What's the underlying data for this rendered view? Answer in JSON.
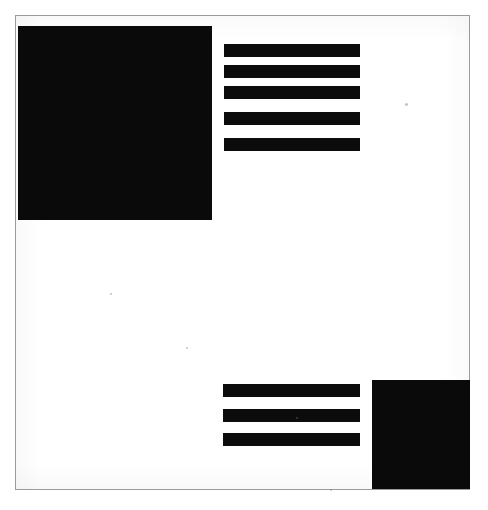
{
  "image": {
    "title": "Abstract black and white geometric pattern",
    "description": "High-contrast scanned graphic with solid black squares and horizontal bar groups on white paper",
    "width": 488,
    "height": 510,
    "background_color": "#ffffff",
    "ink_color": "#0a0a0a",
    "frame_color": "#9a9a9a"
  },
  "frame": {
    "label": "paper-frame",
    "x": 15,
    "y": 15,
    "width": 455,
    "height": 475,
    "border_width": 1
  },
  "shapes": [
    {
      "name": "top-left-square",
      "type": "rectangle",
      "color": "#0a0a0a",
      "x": 18,
      "y": 26,
      "width": 194,
      "height": 194
    },
    {
      "name": "bottom-right-square",
      "type": "rectangle",
      "color": "#0a0a0a",
      "x": 372,
      "y": 380,
      "width": 98,
      "height": 109
    }
  ],
  "bar_groups": [
    {
      "name": "upper-bar-group",
      "count": 5,
      "color": "#0c0c0c",
      "x": 224,
      "y": 44,
      "bar_width": 136,
      "bar_height": 13,
      "gap": 8,
      "bars": [
        {
          "label": "upper-bar-1",
          "y": 44
        },
        {
          "label": "upper-bar-2",
          "y": 65
        },
        {
          "label": "upper-bar-3",
          "y": 86
        },
        {
          "label": "upper-bar-4",
          "y": 112
        },
        {
          "label": "upper-bar-5",
          "y": 138
        }
      ]
    },
    {
      "name": "lower-bar-group",
      "count": 3,
      "color": "#0c0c0c",
      "x": 223,
      "y": 384,
      "bar_width": 137,
      "bar_height": 13,
      "gap": 12,
      "bars": [
        {
          "label": "lower-bar-1",
          "y": 384
        },
        {
          "label": "lower-bar-2",
          "y": 409
        },
        {
          "label": "lower-bar-3",
          "y": 433
        }
      ]
    }
  ],
  "specks": [
    {
      "label": "speck-1",
      "x": 405,
      "y": 103,
      "size": 3
    },
    {
      "label": "speck-2",
      "x": 110,
      "y": 293,
      "size": 2
    },
    {
      "label": "speck-3",
      "x": 296,
      "y": 417,
      "size": 2
    },
    {
      "label": "speck-4",
      "x": 186,
      "y": 347,
      "size": 2
    },
    {
      "label": "speck-5",
      "x": 330,
      "y": 489,
      "size": 2
    }
  ]
}
